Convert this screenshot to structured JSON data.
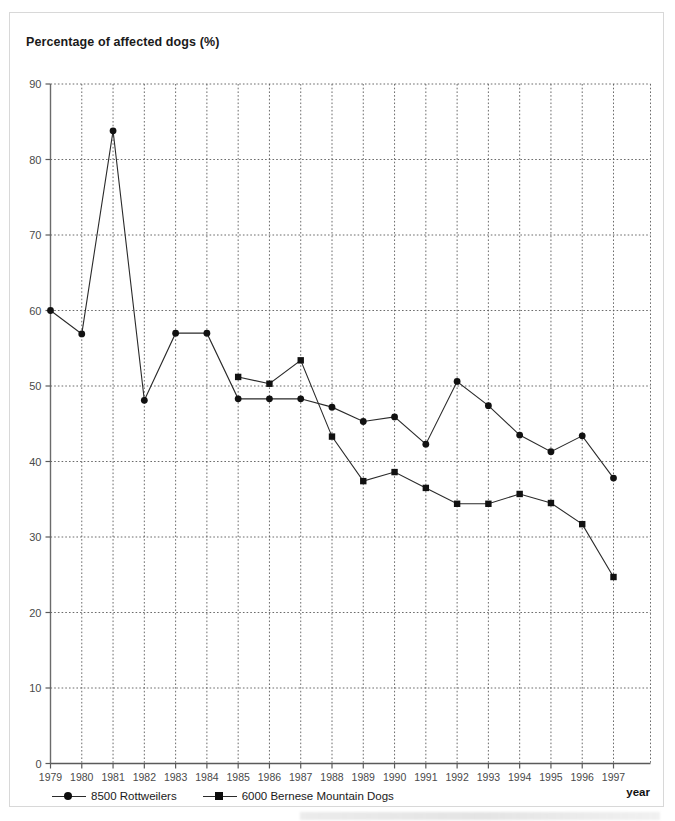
{
  "chart_data": {
    "type": "line",
    "title": "Percentage of affected dogs (%)",
    "xlabel": "year",
    "ylabel": "Percentage of affected dogs (%)",
    "xlim": [
      1979,
      1997
    ],
    "ylim": [
      0,
      90
    ],
    "ytick_step": 10,
    "grid": true,
    "legend_position": "below-left",
    "x": [
      1979,
      1980,
      1981,
      1982,
      1983,
      1984,
      1985,
      1986,
      1987,
      1988,
      1989,
      1990,
      1991,
      1992,
      1993,
      1994,
      1995,
      1996,
      1997
    ],
    "xtick_labels": [
      "1979",
      "1980",
      "1981",
      "1982",
      "1983",
      "1984",
      "1985",
      "1986",
      "1987",
      "1988",
      "1989",
      "1990",
      "1991",
      "1992",
      "1993",
      "1994",
      "1995",
      "1996",
      "1997"
    ],
    "ytick_labels": [
      "0",
      "10",
      "20",
      "30",
      "40",
      "50",
      "60",
      "70",
      "80",
      "90"
    ],
    "ytick_values": [
      0,
      10,
      20,
      30,
      40,
      50,
      60,
      70,
      80,
      90
    ],
    "series": [
      {
        "name": "8500 Rottweilers",
        "marker": "circle",
        "color": "#111111",
        "x": [
          1979,
          1980,
          1981,
          1982,
          1983,
          1984,
          1985,
          1986,
          1987,
          1988,
          1989,
          1990,
          1991,
          1992,
          1993,
          1994,
          1995,
          1996,
          1997
        ],
        "values": [
          60.0,
          56.9,
          83.8,
          48.1,
          57.0,
          57.0,
          48.3,
          48.3,
          48.3,
          47.2,
          45.3,
          45.9,
          42.3,
          50.6,
          47.4,
          43.5,
          41.3,
          43.4,
          37.8
        ]
      },
      {
        "name": "6000 Bernese Mountain Dogs",
        "marker": "square",
        "color": "#111111",
        "x": [
          1985,
          1986,
          1987,
          1988,
          1989,
          1990,
          1991,
          1992,
          1993,
          1994,
          1995,
          1996,
          1997
        ],
        "values": [
          51.2,
          50.3,
          53.4,
          43.3,
          37.4,
          38.6,
          36.5,
          34.4,
          34.4,
          35.7,
          34.5,
          31.7,
          24.7
        ]
      }
    ]
  },
  "legend": {
    "items": [
      {
        "label": "8500 Rottweilers",
        "marker": "circle"
      },
      {
        "label": "6000 Bernese Mountain Dogs",
        "marker": "square"
      }
    ]
  },
  "axis": {
    "x_title": "year",
    "y_title": "Percentage of affected dogs (%)"
  },
  "colors": {
    "line": "#2a2a2a",
    "marker": "#111111",
    "grid": "#5a5a5a",
    "axis": "#555555",
    "text": "#1a1a1a",
    "frame": "#d8d8d8"
  }
}
